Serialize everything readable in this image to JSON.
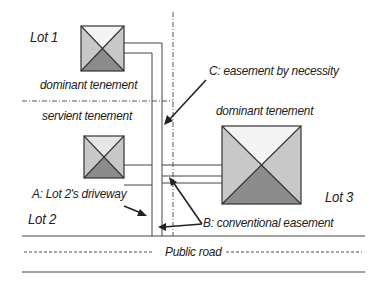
{
  "diagram": {
    "title": "",
    "labels": {
      "lot1": "Lot 1",
      "lot2": "Lot 2",
      "lot3": "Lot 3",
      "dominant_tenement_lot1": "dominant tenement",
      "servient_tenement": "servient tenement",
      "dominant_tenement_lot3": "dominant tenement",
      "easement_a": "A: Lot 2's driveway",
      "easement_b": "B: conventional easement",
      "easement_c": "C: easement by necessity",
      "public_road": "Public road"
    },
    "colors": {
      "line": "#333333",
      "house_light": "#c8c8c8",
      "house_top": "#f4f4f4",
      "house_dark": "#8c8c8c",
      "background": "#ffffff"
    },
    "nodes": [
      {
        "id": "house-lot1",
        "type": "house",
        "lot": "Lot 1"
      },
      {
        "id": "house-lot2",
        "type": "house",
        "lot": "Lot 2"
      },
      {
        "id": "house-lot3",
        "type": "house",
        "lot": "Lot 3"
      }
    ],
    "edges": [
      {
        "from": "house-lot1",
        "to": "public-road",
        "label": "C: easement by necessity"
      },
      {
        "from": "house-lot2",
        "to": "public-road",
        "label": "A: Lot 2's driveway"
      },
      {
        "from": "house-lot3",
        "to": "public-road",
        "label": "B: conventional easement"
      }
    ]
  }
}
